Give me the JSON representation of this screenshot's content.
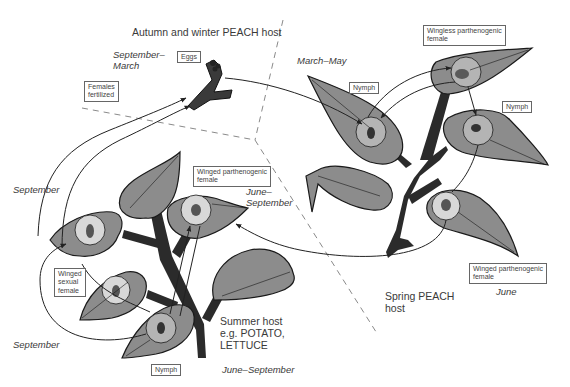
{
  "colors": {
    "leaf_fill": "#8c8c8c",
    "leaf_stroke": "#1a1a1a",
    "stem": "#2b2b2b",
    "circle_fill": "#b4b4b4",
    "dash_line": "#8a8a8a",
    "arrow": "#222222",
    "text": "#333333"
  },
  "regions": {
    "autumn_winter": "Autumn and winter PEACH host",
    "spring": {
      "line1": "Spring PEACH",
      "line2": "host"
    },
    "summer": {
      "line1": "Summer host",
      "line2": "e.g. POTATO,",
      "line3": "LETTUCE"
    }
  },
  "seasons": {
    "sep_march": {
      "line1": "September–",
      "line2": "March"
    },
    "march_may": "March–May",
    "september_upper": "September",
    "september_lower": "September",
    "june_sept_mid": {
      "line1": "June–",
      "line2": "September"
    },
    "june_sept_bottom": "June–September",
    "june": "June"
  },
  "labels": {
    "eggs": "Eggs",
    "females_fertilized": {
      "line1": "Females",
      "line2": "fertilized"
    },
    "wingless_parthenogenic": {
      "line1": "Wingless parthenogenic",
      "line2": "female"
    },
    "nymph_spring_left": "Nymph",
    "nymph_spring_right": "Nymph",
    "winged_parthenogenic_summer": {
      "line1": "Winged parthenogenic",
      "line2": "female"
    },
    "winged_sexual": {
      "line1": "Winged",
      "line2": "sexual",
      "line3": "female"
    },
    "nymph_summer": "Nymph",
    "winged_parthenogenic_spring": {
      "line1": "Winged parthenogenic",
      "line2": "female"
    }
  }
}
